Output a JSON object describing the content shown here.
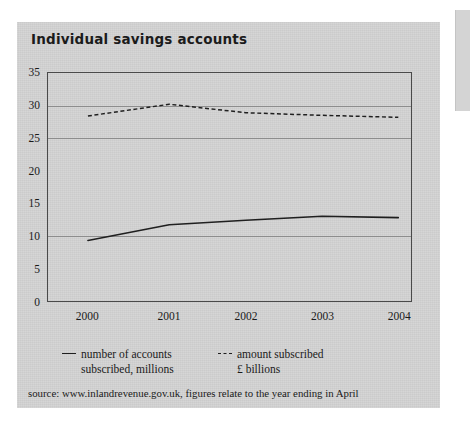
{
  "chart_data": {
    "type": "line",
    "title": "Individual savings accounts",
    "xlabel": "",
    "ylabel": "",
    "x": [
      "2000",
      "2001",
      "2002",
      "2003",
      "2004"
    ],
    "categories": [
      "2000",
      "2001",
      "2002",
      "2003",
      "2004"
    ],
    "ylim": [
      0,
      35
    ],
    "yticks": [
      0,
      5,
      10,
      15,
      20,
      25,
      30,
      35
    ],
    "ytick_labels": [
      "0",
      "5",
      "10",
      "15",
      "20",
      "25",
      "30",
      "35"
    ],
    "xtick_labels": [
      "2000",
      "2001",
      "2002",
      "2003",
      "2004"
    ],
    "gridlines": [
      10,
      25,
      30
    ],
    "grid": true,
    "legend_position": "bottom",
    "series": [
      {
        "name": "number of accounts subscribed, millions",
        "style": "solid",
        "color": "#1f1f1f",
        "values": [
          9.3,
          11.7,
          12.4,
          13.0,
          12.8
        ]
      },
      {
        "name": "amount subscribed £ billions",
        "style": "dashed",
        "color": "#1f1f1f",
        "values": [
          28.4,
          30.2,
          28.9,
          28.5,
          28.2
        ]
      }
    ],
    "annotations": [
      "source: www.inlandrevenue.gov.uk,  figures relate to the year ending in April"
    ]
  },
  "legend": {
    "accounts": {
      "line1": "number of accounts",
      "line2": "subscribed, millions",
      "marker": "solid-line-icon"
    },
    "amount": {
      "line1": "amount subscribed",
      "line2": "£ billions",
      "marker": "dashed-line-icon"
    }
  },
  "source": {
    "text": "source: www.inlandrevenue.gov.uk,  figures relate to the year ending in April"
  },
  "colors": {
    "page_background": "#d2d2d2",
    "ink": "#1a1a1a",
    "frame": "#4a4a4a",
    "gridline": "#8d8d8d"
  }
}
